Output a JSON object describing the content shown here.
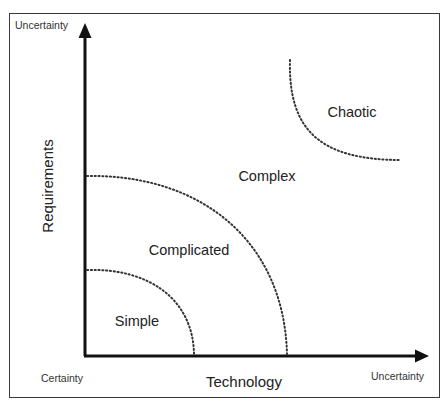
{
  "diagram": {
    "type": "stacey-matrix",
    "y_axis": {
      "title": "Requirements",
      "top_label": "Uncertainty"
    },
    "x_axis": {
      "title": "Technology",
      "left_label": "Certainty",
      "right_label": "Uncertainty"
    },
    "regions": [
      {
        "name": "Simple",
        "label": "Simple"
      },
      {
        "name": "Complicated",
        "label": "Complicated"
      },
      {
        "name": "Complex",
        "label": "Complex"
      },
      {
        "name": "Chaotic",
        "label": "Chaotic"
      }
    ],
    "colors": {
      "axis": "#111111",
      "boundary": "#333333",
      "frame": "#3a3a3a",
      "text": "#222222",
      "background": "#ffffff"
    }
  }
}
